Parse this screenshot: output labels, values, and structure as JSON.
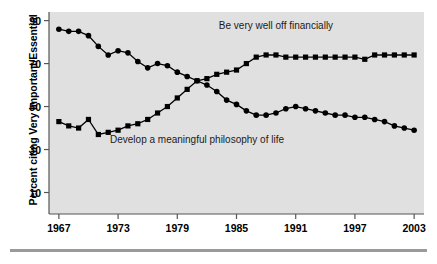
{
  "figure": {
    "plot_bg_color": "#e0e0e0",
    "axis_color": "#555555",
    "marker_color": "#000000",
    "rule_color": "#9a9a9a"
  },
  "axes": {
    "ylabel": "Percent citing Very Important/Essential",
    "xlabel": "",
    "yticks": [
      "90",
      "70",
      "50",
      "30",
      "10"
    ],
    "ytick_values": [
      90,
      70,
      50,
      30,
      10
    ],
    "xticks": [
      "1967",
      "1973",
      "1979",
      "1985",
      "1991",
      "1997",
      "2003"
    ],
    "xtick_values": [
      1967,
      1973,
      1979,
      1985,
      1991,
      1997,
      2003
    ],
    "ylim": [
      0,
      94
    ],
    "xlim": [
      1966,
      2004
    ]
  },
  "annotations": [
    {
      "name": "label-financially",
      "text": "Be very well off financially",
      "x": 1989,
      "y": 86
    },
    {
      "name": "label-philosophy",
      "text": "Develop a meaningful philosophy of life",
      "x": 1981,
      "y": 33
    }
  ],
  "chart_data": {
    "type": "line",
    "title": "",
    "xlabel": "",
    "ylabel": "Percent citing Very Important/Essential",
    "xlim": [
      1966,
      2004
    ],
    "ylim": [
      0,
      94
    ],
    "grid": false,
    "legend_position": "inline-annotation",
    "x": [
      1967,
      1968,
      1969,
      1970,
      1971,
      1972,
      1973,
      1974,
      1975,
      1976,
      1977,
      1978,
      1979,
      1980,
      1981,
      1982,
      1983,
      1984,
      1985,
      1986,
      1987,
      1988,
      1989,
      1990,
      1991,
      1992,
      1993,
      1994,
      1995,
      1996,
      1997,
      1998,
      1999,
      2000,
      2001,
      2002,
      2003
    ],
    "series": [
      {
        "name": "Be very well off financially",
        "marker": "square",
        "values": [
          43,
          41,
          40,
          44,
          37,
          38,
          39,
          41,
          42,
          44,
          47,
          50,
          54,
          58,
          62,
          63,
          65,
          66,
          67,
          70,
          73,
          74,
          74,
          73,
          73,
          73,
          73,
          73,
          73,
          73,
          73,
          72,
          74,
          74,
          74,
          74,
          74
        ]
      },
      {
        "name": "Develop a meaningful philosophy of life",
        "marker": "circle",
        "values": [
          86,
          85,
          85,
          83,
          78,
          74,
          76,
          75,
          71,
          68,
          70,
          69,
          66,
          64,
          62,
          60,
          57,
          53,
          51,
          48,
          46,
          46,
          47,
          49,
          50,
          49,
          48,
          47,
          46,
          46,
          45,
          45,
          44,
          43,
          41,
          40,
          39
        ]
      }
    ]
  }
}
